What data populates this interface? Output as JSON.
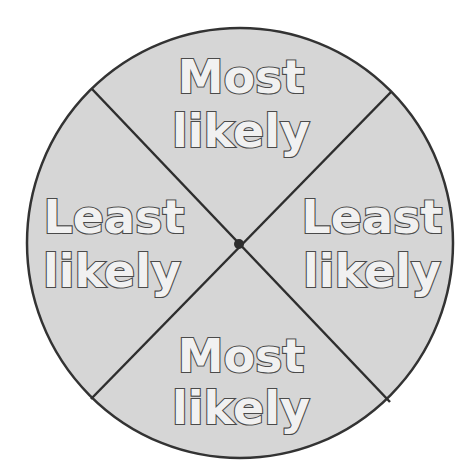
{
  "spinner": {
    "center": {
      "x": 240,
      "y": 243
    },
    "radius": 214,
    "fill_color": "#d6d6d6",
    "outline_color": "#333333",
    "divider_color": "#2e2e2e",
    "hub_color": "#2e2e2e",
    "text_fill_color": "#f1f1f1",
    "text_outline_color": "#4a4a4a",
    "sections": [
      {
        "position": "top",
        "line1": "Most",
        "line2": "likely"
      },
      {
        "position": "right",
        "line1": "Least",
        "line2": "likely"
      },
      {
        "position": "bottom",
        "line1": "Most",
        "line2": "likely"
      },
      {
        "position": "left",
        "line1": "Least",
        "line2": "likely"
      }
    ]
  }
}
